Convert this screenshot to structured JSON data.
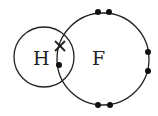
{
  "diagram": {
    "atoms": [
      {
        "symbol": "H",
        "label": "H"
      },
      {
        "symbol": "F",
        "label": "F"
      }
    ],
    "electrons": {
      "hydrogen_cross": "×",
      "fluorine_dots": 8
    },
    "colors": {
      "line": "#222222",
      "background": "#ffffff"
    }
  }
}
